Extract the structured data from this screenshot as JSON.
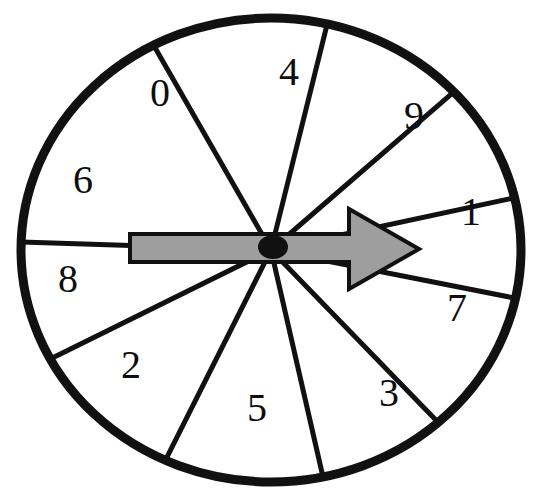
{
  "figure": {
    "name": "probability-spinner",
    "background_color": "#ffffff"
  },
  "wheel": {
    "center_x": 271,
    "center_y": 250,
    "radius_x": 250,
    "radius_y": 232,
    "outline_color": "#111111",
    "outline_width": 9,
    "sector_fill": "#ffffff",
    "divider_color": "#111111",
    "divider_width": 5,
    "sector_count": 10
  },
  "sectors": [
    {
      "label": "0",
      "start_angle": -118,
      "end_angle": -77,
      "label_x": 160,
      "label_y": 97
    },
    {
      "label": "4",
      "start_angle": -77,
      "end_angle": -43,
      "label_x": 289,
      "label_y": 76
    },
    {
      "label": "9",
      "start_angle": -43,
      "end_angle": -13,
      "label_x": 414,
      "label_y": 120
    },
    {
      "label": "1",
      "start_angle": -13,
      "end_angle": 12,
      "label_x": 471,
      "label_y": 216
    },
    {
      "label": "7",
      "start_angle": 12,
      "end_angle": 48,
      "label_x": 457,
      "label_y": 312
    },
    {
      "label": "3",
      "start_angle": 48,
      "end_angle": 78,
      "label_x": 389,
      "label_y": 397
    },
    {
      "label": "5",
      "start_angle": 78,
      "end_angle": 115,
      "label_x": 257,
      "label_y": 412
    },
    {
      "label": "2",
      "start_angle": 115,
      "end_angle": 152,
      "label_x": 131,
      "label_y": 369
    },
    {
      "label": "8",
      "start_angle": 152,
      "end_angle": 182,
      "label_x": 68,
      "label_y": 283
    },
    {
      "label": "6",
      "start_angle": 182,
      "end_angle": 242,
      "label_x": 83,
      "label_y": 184
    }
  ],
  "arrow": {
    "name": "spinner-pointer",
    "direction": "right",
    "points_to_sector": "1",
    "fill_color": "#9e9e9e",
    "stroke_color": "#111111",
    "stroke_width": 4,
    "tail_x": 130,
    "tip_x": 419,
    "shaft_top_y": 234,
    "shaft_bottom_y": 262,
    "head_start_x": 349,
    "head_top_y": 209,
    "head_bottom_y": 289
  },
  "hub": {
    "name": "spinner-hub",
    "center_x": 273,
    "center_y": 247,
    "radius_x": 15,
    "radius_y": 12,
    "color": "#111111"
  }
}
